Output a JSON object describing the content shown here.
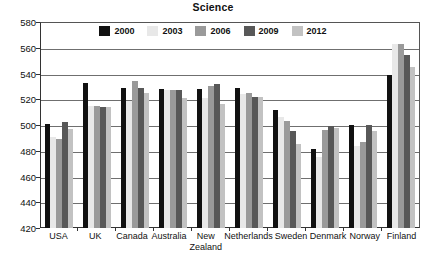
{
  "chart_data": {
    "type": "bar",
    "title": "Science",
    "xlabel": "",
    "ylabel": "",
    "ylim": [
      420,
      580
    ],
    "yticks": [
      420,
      440,
      460,
      480,
      500,
      520,
      540,
      560,
      580
    ],
    "grid": true,
    "legend_position": "top-inside",
    "categories": [
      "USA",
      "UK",
      "Canada",
      "Australia",
      "New Zealand",
      "Netherlands",
      "Sweden",
      "Denmark",
      "Norway",
      "Finland"
    ],
    "category_lines": [
      [
        "USA"
      ],
      [
        "UK"
      ],
      [
        "Canada"
      ],
      [
        "Australia"
      ],
      [
        "New",
        "Zealand"
      ],
      [
        "Netherlands"
      ],
      [
        "Sweden"
      ],
      [
        "Denmark"
      ],
      [
        "Norway"
      ],
      [
        "Finland"
      ]
    ],
    "series": [
      {
        "name": "2000",
        "color": "#111111",
        "values": [
          501,
          533,
          529,
          528,
          528,
          529,
          512,
          481,
          500,
          539
        ]
      },
      {
        "name": "2003",
        "color": "#e8e8e8",
        "values": [
          491,
          515,
          519,
          527,
          521,
          524,
          506,
          475,
          484,
          563
        ]
      },
      {
        "name": "2006",
        "color": "#9a9a9a",
        "values": [
          489,
          515,
          534,
          527,
          530,
          525,
          503,
          496,
          487,
          563
        ]
      },
      {
        "name": "2009",
        "color": "#585858",
        "values": [
          502,
          514,
          529,
          527,
          532,
          522,
          495,
          499,
          500,
          554
        ]
      },
      {
        "name": "2012",
        "color": "#c2c2c2",
        "values": [
          497,
          514,
          525,
          521,
          516,
          522,
          485,
          498,
          495,
          545
        ]
      }
    ]
  }
}
